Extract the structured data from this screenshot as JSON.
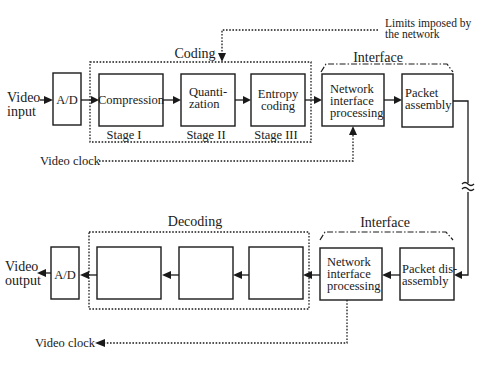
{
  "colors": {
    "ink": "#1a1a1a",
    "background": "#ffffff"
  },
  "annotation": {
    "limits_line1": "Limits imposed by",
    "limits_line2": "the network"
  },
  "encoder": {
    "input_label_line1": "Video",
    "input_label_line2": "input",
    "ad_label": "A/D",
    "coding_group_label": "Coding",
    "stages": [
      {
        "label_line1": "Compression",
        "label_line2": "",
        "stage": "Stage I"
      },
      {
        "label_line1": "Quanti-",
        "label_line2": "zation",
        "stage": "Stage II"
      },
      {
        "label_line1": "Entropy",
        "label_line2": "coding",
        "stage": "Stage III"
      }
    ],
    "interface_group_label": "Interface",
    "network_line1": "Network",
    "network_line2": "interface",
    "network_line3": "processing",
    "packet_line1": "Packet",
    "packet_line2": "assembly",
    "clock_label": "Video clock"
  },
  "channel": {
    "break_symbol": "≈"
  },
  "decoder": {
    "output_label_line1": "Video",
    "output_label_line2": "output",
    "ad_label": "A/D",
    "decoding_group_label": "Decoding",
    "stages": [
      {
        "label": ""
      },
      {
        "label": ""
      },
      {
        "label": ""
      }
    ],
    "interface_group_label": "Interface",
    "network_line1": "Network",
    "network_line2": "interface",
    "network_line3": "processing",
    "packet_line1": "Packet dis-",
    "packet_line2": "assembly",
    "clock_label": "Video clock"
  }
}
